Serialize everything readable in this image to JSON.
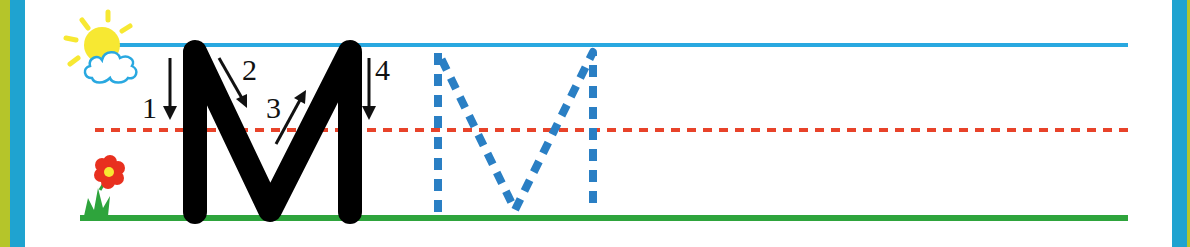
{
  "worksheet": {
    "letter": "M",
    "stroke_numbers": [
      "1",
      "2",
      "3",
      "4"
    ],
    "colors": {
      "top_line": "#29a8e0",
      "mid_line": "#e8432a",
      "base_line": "#2ea43c",
      "solid_letter": "#000000",
      "trace_letter": "#2a7fc4",
      "frame_blue": "#1fa3d0",
      "frame_olive": "#b5c52a"
    },
    "decorations": [
      "sun-icon",
      "cloud-icon",
      "flower-icon",
      "grass-icon"
    ]
  }
}
